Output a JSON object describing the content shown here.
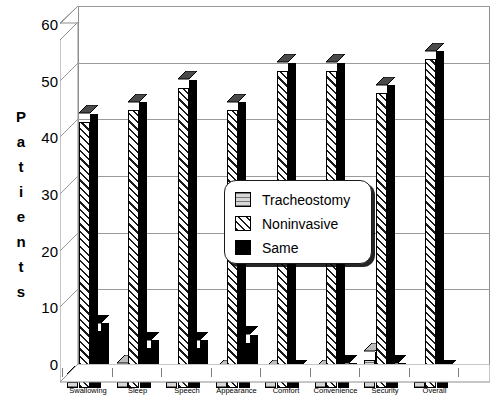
{
  "chart_data": {
    "type": "bar",
    "title": "",
    "subtitle": "",
    "xlabel": "",
    "ylabel": "Patients",
    "ylim": [
      0,
      60
    ],
    "yticks": [
      0,
      10,
      20,
      30,
      40,
      50,
      60
    ],
    "ytick_labels": [
      "0",
      "10",
      "20",
      "30",
      "40",
      "50",
      "60"
    ],
    "grid": true,
    "style": "3d-clustered-column",
    "legend_position": "center-right-inset",
    "categories": [
      "Swallowing",
      "Sleep",
      "Speech",
      "Appearance",
      "Comfort",
      "Convenience",
      "Security",
      "Overall"
    ],
    "series": [
      {
        "name": "Tracheostomy",
        "fill": "light-gray-horizontal-lines",
        "color": "#d8d8d8",
        "values": [
          1,
          3,
          1,
          2,
          2,
          2,
          5,
          1
        ]
      },
      {
        "name": "Noninvasive",
        "fill": "diagonal-hatch",
        "color": "#ffffff",
        "values": [
          47,
          49,
          53,
          49,
          56,
          56,
          52,
          58
        ]
      },
      {
        "name": "Same",
        "fill": "solid-black",
        "color": "#000000",
        "values": [
          10,
          7,
          7,
          8,
          2,
          3,
          3,
          2
        ]
      }
    ]
  },
  "axis": {
    "y_title_letters": [
      "P",
      "a",
      "t",
      "i",
      "e",
      "n",
      "t",
      "s"
    ]
  },
  "legend": {
    "items": [
      {
        "label": "Tracheostomy",
        "swatch": "tracheostomy-swatch"
      },
      {
        "label": "Noninvasive",
        "swatch": "noninvasive-swatch"
      },
      {
        "label": "Same",
        "swatch": "same-swatch"
      }
    ]
  },
  "colors": {
    "axis_line": "#8e8e8e",
    "grid_line": "#9a9a9a",
    "text": "#000000",
    "plot_background": "#ffffff"
  }
}
